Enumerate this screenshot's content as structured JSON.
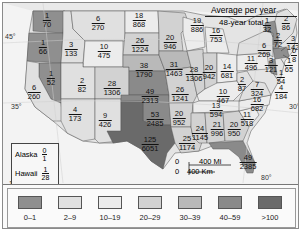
{
  "title": {
    "line1": "Average per year",
    "line2": "48-year total"
  },
  "degrees": {
    "lat45": "45°",
    "lat35": "35°",
    "lat30": "30°",
    "lon120": "120°",
    "lon80": "80°"
  },
  "states": [
    {
      "id": "WA",
      "avg": "1",
      "total": "70",
      "x": 44,
      "y": 17
    },
    {
      "id": "OR",
      "avg": "1",
      "total": "66",
      "x": 40,
      "y": 44
    },
    {
      "id": "ID",
      "avg": "3",
      "total": "133",
      "x": 68,
      "y": 46
    },
    {
      "id": "MT",
      "avg": "6",
      "total": "270",
      "x": 95,
      "y": 20
    },
    {
      "id": "NV",
      "avg": "1",
      "total": "52",
      "x": 48,
      "y": 75
    },
    {
      "id": "CA",
      "avg": "6",
      "total": "260",
      "x": 31,
      "y": 89
    },
    {
      "id": "WY",
      "avg": "10",
      "total": "475",
      "x": 101,
      "y": 48
    },
    {
      "id": "UT",
      "avg": "2",
      "total": "82",
      "x": 79,
      "y": 82
    },
    {
      "id": "AZ",
      "avg": "4",
      "total": "173",
      "x": 72,
      "y": 111
    },
    {
      "id": "CO",
      "avg": "28",
      "total": "1306",
      "x": 109,
      "y": 85
    },
    {
      "id": "NM",
      "avg": "9",
      "total": "426",
      "x": 102,
      "y": 117
    },
    {
      "id": "ND",
      "avg": "18",
      "total": "868",
      "x": 136,
      "y": 17
    },
    {
      "id": "SD",
      "avg": "26",
      "total": "1224",
      "x": 137,
      "y": 42
    },
    {
      "id": "NE",
      "avg": "38",
      "total": "1790",
      "x": 141,
      "y": 67
    },
    {
      "id": "KS",
      "avg": "49",
      "total": "2313",
      "x": 147,
      "y": 93
    },
    {
      "id": "OK",
      "avg": "53",
      "total": "2485",
      "x": 152,
      "y": 116
    },
    {
      "id": "TX",
      "avg": "125",
      "total": "6051",
      "x": 147,
      "y": 141
    },
    {
      "id": "MN",
      "avg": "20",
      "total": "946",
      "x": 167,
      "y": 39
    },
    {
      "id": "IA",
      "avg": "31",
      "total": "1463",
      "x": 171,
      "y": 66
    },
    {
      "id": "MO",
      "avg": "26",
      "total": "1241",
      "x": 177,
      "y": 91
    },
    {
      "id": "AR",
      "avg": "20",
      "total": "952",
      "x": 176,
      "y": 115
    },
    {
      "id": "LA",
      "avg": "25",
      "total": "1174",
      "x": 184,
      "y": 140
    },
    {
      "id": "WI",
      "avg": "19",
      "total": "886",
      "x": 194,
      "y": 22
    },
    {
      "id": "IL",
      "avg": "28",
      "total": "1306",
      "x": 191,
      "y": 71
    },
    {
      "id": "MS",
      "avg": "24",
      "total": "1145",
      "x": 197,
      "y": 130
    },
    {
      "id": "MI",
      "avg": "16",
      "total": "753",
      "x": 213,
      "y": 32
    },
    {
      "id": "IN",
      "avg": "20",
      "total": "942",
      "x": 206,
      "y": 69
    },
    {
      "id": "OH",
      "avg": "14",
      "total": "681",
      "x": 224,
      "y": 68
    },
    {
      "id": "KY",
      "avg": "10",
      "total": "467",
      "x": 220,
      "y": 93
    },
    {
      "id": "TN",
      "avg": "13",
      "total": "594",
      "x": 213,
      "y": 107
    },
    {
      "id": "AL",
      "avg": "21",
      "total": "996",
      "x": 214,
      "y": 126
    },
    {
      "id": "GA",
      "avg": "20",
      "total": "950",
      "x": 231,
      "y": 126
    },
    {
      "id": "FL",
      "avg": "49",
      "total": "2385",
      "x": 245,
      "y": 159
    },
    {
      "id": "SC",
      "avg": "11",
      "total": "518",
      "x": 244,
      "y": 116
    },
    {
      "id": "NC",
      "avg": "16",
      "total": "682",
      "x": 254,
      "y": 101
    },
    {
      "id": "VA",
      "avg": "7",
      "total": "324",
      "x": 254,
      "y": 86
    },
    {
      "id": "WV",
      "avg": "2",
      "total": "87",
      "x": 239,
      "y": 81
    },
    {
      "id": "PA",
      "avg": "11",
      "total": "496",
      "x": 248,
      "y": 60
    },
    {
      "id": "NY",
      "avg": "6",
      "total": "269",
      "x": 261,
      "y": 47
    },
    {
      "id": "VT",
      "avg": "1",
      "total": "32",
      "x": 264,
      "y": 22
    },
    {
      "id": "NH",
      "avg": "2",
      "total": "72",
      "x": 275,
      "y": 37
    },
    {
      "id": "ME",
      "avg": "2",
      "total": "86",
      "x": 283,
      "y": 20
    },
    {
      "id": "MA",
      "avg": "3",
      "total": "142",
      "x": 290,
      "y": 40
    },
    {
      "id": "RI",
      "avg": "0",
      "total": "8",
      "x": 291,
      "y": 52
    },
    {
      "id": "CT",
      "avg": "1",
      "total": "65",
      "x": 286,
      "y": 62
    },
    {
      "id": "NJ",
      "avg": "3",
      "total": "121",
      "x": 268,
      "y": 62
    },
    {
      "id": "DE",
      "avg": "1",
      "total": "54",
      "x": 278,
      "y": 74
    },
    {
      "id": "MD",
      "avg": "4",
      "total": "184",
      "x": 278,
      "y": 89
    }
  ],
  "insets": {
    "alaska": {
      "label": "Alaska",
      "avg": "0",
      "total": "1"
    },
    "hawaii": {
      "label": "Hawaii",
      "avg": "1",
      "total": "28"
    }
  },
  "scale": {
    "zero1": "0",
    "miles": "400 Mi",
    "zero2": "0",
    "km": "400 Km"
  },
  "legend": {
    "items": [
      {
        "label": "0–1",
        "color": "#8f8f8f"
      },
      {
        "label": "2–9",
        "color": "#e0e0e0"
      },
      {
        "label": "10–19",
        "color": "#ececec"
      },
      {
        "label": "20–29",
        "color": "#d2d2d2"
      },
      {
        "label": "30–39",
        "color": "#b9b9b9"
      },
      {
        "label": "40–59",
        "color": "#8a8a8a"
      },
      {
        "label": ">100",
        "color": "#6a6a6a"
      }
    ]
  }
}
